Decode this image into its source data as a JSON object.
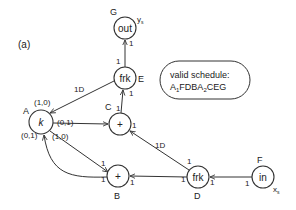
{
  "figure": {
    "panel_label": "(a)",
    "schedule_box": {
      "line1": "valid schedule:",
      "line2_parts": [
        "A",
        "1",
        "FDBA",
        "2",
        "CEG"
      ]
    }
  },
  "nodes": [
    {
      "id": "G",
      "label": "out",
      "note": "ys"
    },
    {
      "id": "E",
      "label": "frk"
    },
    {
      "id": "C",
      "label": "+"
    },
    {
      "id": "A",
      "label": "k"
    },
    {
      "id": "B",
      "label": "+"
    },
    {
      "id": "D",
      "label": "frk"
    },
    {
      "id": "F",
      "label": "in",
      "note": "xs"
    }
  ],
  "note_sub": {
    "G": "s",
    "F": "s"
  },
  "note_main": {
    "G": "y",
    "F": "x"
  },
  "edges": [
    {
      "from": "E",
      "to": "G",
      "src_rate": "1",
      "dst_rate": "1"
    },
    {
      "from": "C",
      "to": "E",
      "src_rate": "1",
      "dst_rate": "1"
    },
    {
      "from": "E",
      "to": "A",
      "delay": "1D",
      "src_rate": "1",
      "dst_rate": "(1,0)"
    },
    {
      "from": "A",
      "to": "C",
      "src_rate": "(0,1)",
      "dst_rate": ""
    },
    {
      "from": "D",
      "to": "C",
      "delay": "1D",
      "src_rate": "1",
      "dst_rate": "1"
    },
    {
      "from": "A",
      "to": "B",
      "src_rate": "(1,0)",
      "dst_rate": "1"
    },
    {
      "from": "B",
      "to": "A",
      "src_rate": "1",
      "dst_rate": "(0,1)"
    },
    {
      "from": "D",
      "to": "B",
      "src_rate": "1",
      "dst_rate": "1"
    },
    {
      "from": "F",
      "to": "D",
      "src_rate": "1",
      "dst_rate": "1"
    }
  ],
  "labels": {
    "rate_1": "1",
    "delay_1D": "1D",
    "rate_10": "(1,0)",
    "rate_01": "(0,1)"
  }
}
